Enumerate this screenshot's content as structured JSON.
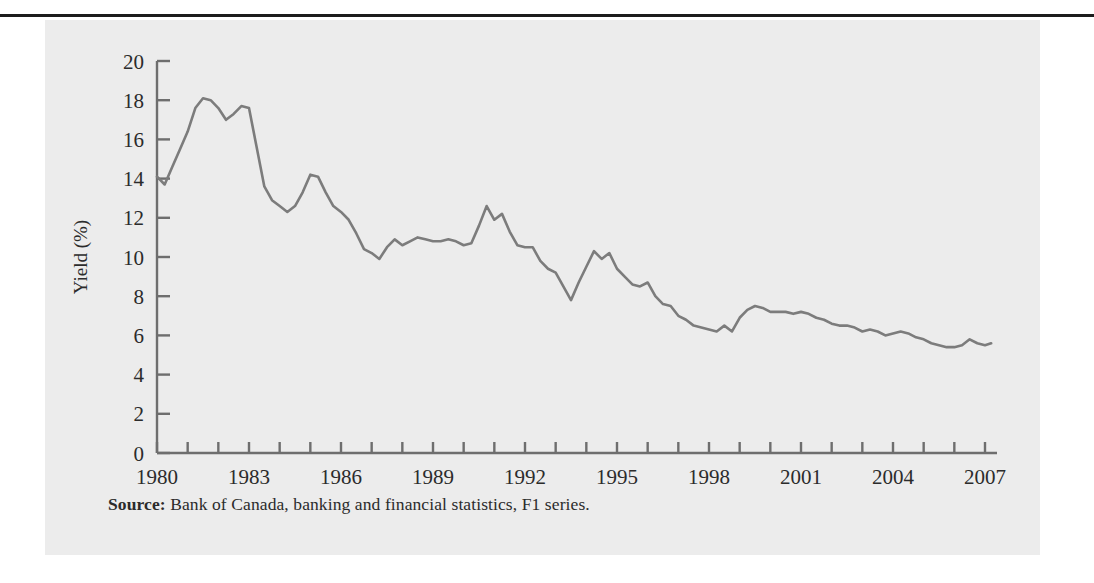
{
  "figure": {
    "caption_lead": "Source:",
    "caption_text": " Bank of Canada, banking and financial statistics, F1 series.",
    "panel_color": "#ececec",
    "rule_color": "#1c1c1c"
  },
  "chart_data": {
    "type": "line",
    "title": "",
    "xlabel": "",
    "ylabel": "Yield (%)",
    "xlim": [
      1980,
      2007
    ],
    "ylim": [
      0,
      20
    ],
    "ytick_labels": [
      "0",
      "2",
      "4",
      "6",
      "8",
      "10",
      "12",
      "14",
      "16",
      "18",
      "20"
    ],
    "ytick_values": [
      0,
      2,
      4,
      6,
      8,
      10,
      12,
      14,
      16,
      18,
      20
    ],
    "xtick_labels": [
      "1980",
      "1983",
      "1986",
      "1989",
      "1992",
      "1995",
      "1998",
      "2001",
      "2004",
      "2007"
    ],
    "xtick_values": [
      1980,
      1983,
      1986,
      1989,
      1992,
      1995,
      1998,
      2001,
      2004,
      2007
    ],
    "xtick_minor_values": [
      1981,
      1982,
      1984,
      1985,
      1987,
      1988,
      1990,
      1991,
      1993,
      1994,
      1996,
      1997,
      1999,
      2000,
      2002,
      2003,
      2005,
      2006
    ],
    "grid": false,
    "legend": null,
    "line_color": "#7c7c7c",
    "line_width": 2.6,
    "series": [
      {
        "name": "Yield (%)",
        "x": [
          1980.0,
          1980.25,
          1980.5,
          1980.75,
          1981.0,
          1981.25,
          1981.5,
          1981.75,
          1982.0,
          1982.25,
          1982.5,
          1982.75,
          1983.0,
          1983.25,
          1983.5,
          1983.75,
          1984.0,
          1984.25,
          1984.5,
          1984.75,
          1985.0,
          1985.25,
          1985.5,
          1985.75,
          1986.0,
          1986.25,
          1986.5,
          1986.75,
          1987.0,
          1987.25,
          1987.5,
          1987.75,
          1988.0,
          1988.25,
          1988.5,
          1988.75,
          1989.0,
          1989.25,
          1989.5,
          1989.75,
          1990.0,
          1990.25,
          1990.5,
          1990.75,
          1991.0,
          1991.25,
          1991.5,
          1991.75,
          1992.0,
          1992.25,
          1992.5,
          1992.75,
          1993.0,
          1993.25,
          1993.5,
          1993.75,
          1994.0,
          1994.25,
          1994.5,
          1994.75,
          1995.0,
          1995.25,
          1995.5,
          1995.75,
          1996.0,
          1996.25,
          1996.5,
          1996.75,
          1997.0,
          1997.25,
          1997.5,
          1997.75,
          1998.0,
          1998.25,
          1998.5,
          1998.75,
          1999.0,
          1999.25,
          1999.5,
          1999.75,
          2000.0,
          2000.25,
          2000.5,
          2000.75,
          2001.0,
          2001.25,
          2001.5,
          2001.75,
          2002.0,
          2002.25,
          2002.5,
          2002.75,
          2003.0,
          2003.25,
          2003.5,
          2003.75,
          2004.0,
          2004.25,
          2004.5,
          2004.75,
          2005.0,
          2005.25,
          2005.5,
          2005.75,
          2006.0,
          2006.25,
          2006.5,
          2006.75,
          2007.0,
          2007.2
        ],
        "y": [
          14.1,
          13.7,
          14.6,
          15.5,
          16.4,
          17.6,
          18.1,
          18.0,
          17.6,
          17.0,
          17.3,
          17.7,
          17.6,
          15.6,
          13.6,
          12.9,
          12.6,
          12.3,
          12.6,
          13.3,
          14.2,
          14.1,
          13.3,
          12.6,
          12.3,
          11.9,
          11.2,
          10.4,
          10.2,
          9.9,
          10.5,
          10.9,
          10.6,
          10.8,
          11.0,
          10.9,
          10.8,
          10.8,
          10.9,
          10.8,
          10.6,
          10.7,
          11.6,
          12.6,
          11.9,
          12.2,
          11.3,
          10.6,
          10.5,
          10.5,
          9.8,
          9.4,
          9.2,
          8.5,
          7.8,
          8.7,
          9.5,
          10.3,
          9.9,
          10.2,
          9.4,
          9.0,
          8.6,
          8.5,
          8.7,
          8.0,
          7.6,
          7.5,
          7.0,
          6.8,
          6.5,
          6.4,
          6.3,
          6.2,
          6.5,
          6.2,
          6.9,
          7.3,
          7.5,
          7.4,
          7.2,
          7.2,
          7.2,
          7.1,
          7.2,
          7.1,
          6.9,
          6.8,
          6.6,
          6.5,
          6.5,
          6.4,
          6.2,
          6.3,
          6.2,
          6.0,
          6.1,
          6.2,
          6.1,
          5.9,
          5.8,
          5.6,
          5.5,
          5.4,
          5.4,
          5.5,
          5.8,
          5.6,
          5.5,
          5.6
        ]
      }
    ]
  }
}
